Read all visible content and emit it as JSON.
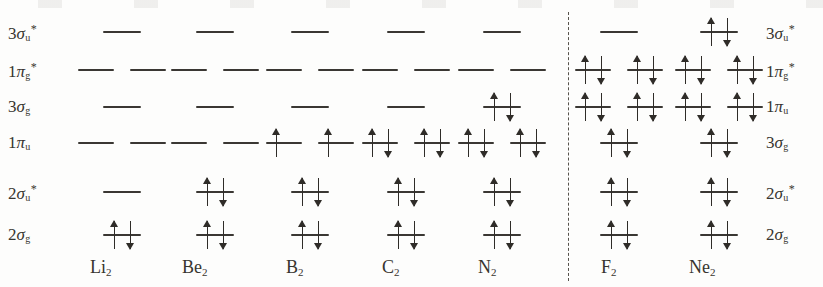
{
  "figure": {
    "type": "molecular-orbital-energy-level-diagram",
    "width": 823,
    "height": 287,
    "background_color": "#fdfdfc",
    "line_color": "#3a3733",
    "arrow_color": "#2f2c28",
    "divider": {
      "style": "dashed",
      "x": 568,
      "y_top": 12,
      "y_bottom": 281
    }
  },
  "rows": [
    {
      "id": "r1",
      "y": 32,
      "left_label_html": "3<i>σ</i><sub>u</sub><sup>*</sup>",
      "right_label_html": "3<i>σ</i><sub>u</sub><sup>*</sup>"
    },
    {
      "id": "r2",
      "y": 70,
      "left_label_html": "1<i>π</i><sub>g</sub><sup>*</sup>",
      "right_label_html": "1<i>π</i><sub>g</sub><sup>*</sup>"
    },
    {
      "id": "r3",
      "y": 107,
      "left_label_html": "3<i>σ</i><sub>g</sub>",
      "right_label_html": "1<i>π</i><sub>u</sub>"
    },
    {
      "id": "r4",
      "y": 143,
      "left_label_html": "1<i>π</i><sub>u</sub>",
      "right_label_html": "3<i>σ</i><sub>g</sub>"
    },
    {
      "id": "r5",
      "y": 192,
      "left_label_html": "2<i>σ</i><sub>u</sub><sup>*</sup>",
      "right_label_html": "2<i>σ</i><sub>u</sub><sup>*</sup>"
    },
    {
      "id": "r6",
      "y": 235,
      "left_label_html": "2<i>σ</i><sub>g</sub>",
      "right_label_html": "2<i>σ</i><sub>g</sub>"
    }
  ],
  "left_labels": [
    {
      "text": "3σu*",
      "x": 8,
      "y": 23
    },
    {
      "text": "1πg*",
      "x": 8,
      "y": 61
    },
    {
      "text": "3σg",
      "x": 8,
      "y": 98
    },
    {
      "text": "1πu",
      "x": 8,
      "y": 134
    },
    {
      "text": "2σu*",
      "x": 8,
      "y": 183
    },
    {
      "text": "2σg",
      "x": 8,
      "y": 226
    }
  ],
  "right_labels": [
    {
      "text": "3σu*",
      "x": 766,
      "y": 23
    },
    {
      "text": "1πg*",
      "x": 766,
      "y": 61
    },
    {
      "text": "1πu",
      "x": 766,
      "y": 98
    },
    {
      "text": "3σg",
      "x": 766,
      "y": 134
    },
    {
      "text": "2σu*",
      "x": 766,
      "y": 183
    },
    {
      "text": "2σg",
      "x": 766,
      "y": 226
    }
  ],
  "molecules": [
    {
      "id": "Li2",
      "symbol": "Li",
      "sub": "2",
      "label_x": 90,
      "center": 122,
      "group": "left"
    },
    {
      "id": "Be2",
      "symbol": "Be",
      "sub": "2",
      "label_x": 182,
      "center": 215,
      "group": "left"
    },
    {
      "id": "B2",
      "symbol": "B",
      "sub": "2",
      "label_x": 286,
      "center": 310,
      "group": "left"
    },
    {
      "id": "C2",
      "symbol": "C",
      "sub": "2",
      "label_x": 382,
      "center": 406,
      "group": "left"
    },
    {
      "id": "N2",
      "symbol": "N",
      "sub": "2",
      "label_x": 478,
      "center": 502,
      "group": "left"
    },
    {
      "id": "F2",
      "symbol": "F",
      "sub": "2",
      "label_x": 601,
      "center": 619,
      "group": "right"
    },
    {
      "id": "Ne2",
      "symbol": "Ne",
      "sub": "2",
      "label_x": 689,
      "center": 719,
      "group": "right"
    }
  ],
  "caption_y": 258,
  "level_geometry": {
    "single_width": 38,
    "pair_width": 36,
    "pair_offset": 26
  },
  "chart_data": {
    "type": "mo-energy-diagram",
    "ordering_note": "Li2-N2 use 3sigma_g above 1pi_u; F2 and Ne2 invert to 1pi_u above 3sigma_g",
    "levels_left_order": [
      "3σu*",
      "1πg*",
      "3σg",
      "1πu",
      "2σu*",
      "2σg"
    ],
    "levels_right_order": [
      "3σu*",
      "1πg*",
      "1πu",
      "3σg",
      "2σu*",
      "2σg"
    ],
    "occupancy": {
      "Li2": {
        "2σg": "updown",
        "2σu*": "empty",
        "1πu": [
          "empty",
          "empty"
        ],
        "3σg": "empty",
        "1πg*": [
          "empty",
          "empty"
        ],
        "3σu*": "empty",
        "valence_electrons": 2
      },
      "Be2": {
        "2σg": "updown",
        "2σu*": "updown",
        "1πu": [
          "empty",
          "empty"
        ],
        "3σg": "empty",
        "1πg*": [
          "empty",
          "empty"
        ],
        "3σu*": "empty",
        "valence_electrons": 4
      },
      "B2": {
        "2σg": "updown",
        "2σu*": "updown",
        "1πu": [
          "up",
          "up"
        ],
        "3σg": "empty",
        "1πg*": [
          "empty",
          "empty"
        ],
        "3σu*": "empty",
        "valence_electrons": 6
      },
      "C2": {
        "2σg": "updown",
        "2σu*": "updown",
        "1πu": [
          "updown",
          "updown"
        ],
        "3σg": "empty",
        "1πg*": [
          "empty",
          "empty"
        ],
        "3σu*": "empty",
        "valence_electrons": 8
      },
      "N2": {
        "2σg": "updown",
        "2σu*": "updown",
        "1πu": [
          "updown",
          "updown"
        ],
        "3σg": "updown",
        "1πg*": [
          "empty",
          "empty"
        ],
        "3σu*": "empty",
        "valence_electrons": 10
      },
      "F2": {
        "2σg": "updown",
        "2σu*": "updown",
        "3σg": "updown",
        "1πu": [
          "updown",
          "updown"
        ],
        "1πg*": [
          "updown",
          "updown"
        ],
        "3σu*": "empty",
        "valence_electrons": 14
      },
      "Ne2": {
        "2σg": "updown",
        "2σu*": "updown",
        "3σg": "updown",
        "1πu": [
          "updown",
          "updown"
        ],
        "1πg*": [
          "updown",
          "updown"
        ],
        "3σu*": "updown",
        "valence_electrons": 16
      }
    }
  }
}
